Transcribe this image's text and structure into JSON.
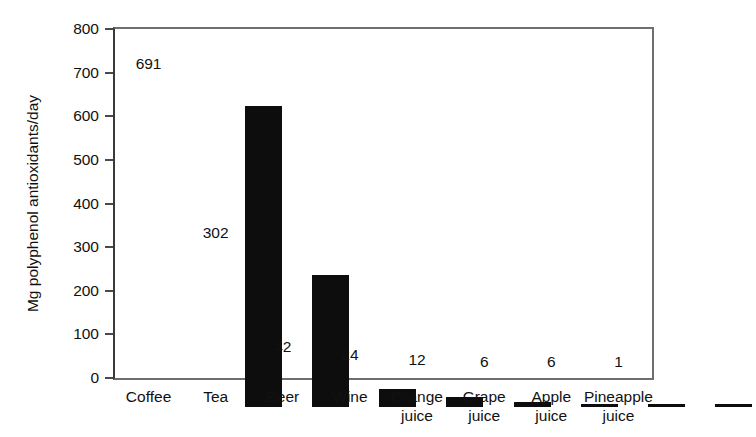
{
  "chart_data": {
    "type": "bar",
    "title": "",
    "xlabel": "",
    "ylabel": "Mg polyphenol antioxidants/day",
    "ylim": [
      0,
      800
    ],
    "ytick_step": 100,
    "yticks": [
      800,
      700,
      600,
      500,
      400,
      300,
      200,
      100,
      0
    ],
    "ytick_labels": [
      "800",
      "700",
      "600",
      "500",
      "400",
      "300",
      "200",
      "100",
      "0"
    ],
    "grid": false,
    "legend": false,
    "bar_color": "#0d0d0d",
    "axis_color": "#6e6e6e",
    "categories": [
      "Coffee",
      "Tea",
      "Beer",
      "Wine",
      "Orange juice",
      "Grape juice",
      "Apple juice",
      "Pineapple juice"
    ],
    "category_lines": [
      [
        "Coffee",
        ""
      ],
      [
        "Tea",
        ""
      ],
      [
        "Beer",
        ""
      ],
      [
        "Wine",
        ""
      ],
      [
        "Orange",
        "juice"
      ],
      [
        "Grape",
        "juice"
      ],
      [
        "Apple",
        "juice"
      ],
      [
        "Pineapple",
        "juice"
      ]
    ],
    "values": [
      691,
      302,
      42,
      24,
      12,
      6,
      6,
      1
    ],
    "value_labels": [
      "691",
      "302",
      "42",
      "24",
      "12",
      "6",
      "6",
      "1"
    ]
  }
}
